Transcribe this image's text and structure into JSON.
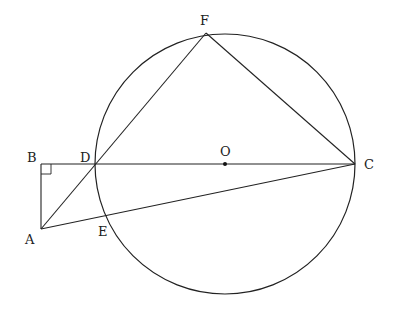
{
  "diagram": {
    "type": "geometry",
    "circle": {
      "center": "O",
      "cx": 225,
      "cy": 164,
      "r": 130
    },
    "points": {
      "A": {
        "label": "A",
        "x": 41,
        "y": 229
      },
      "B": {
        "label": "B",
        "x": 41,
        "y": 164
      },
      "C": {
        "label": "C",
        "x": 355,
        "y": 164
      },
      "D": {
        "label": "D",
        "x": 96,
        "y": 164
      },
      "E": {
        "label": "E",
        "x": 107,
        "y": 217
      },
      "F": {
        "label": "F",
        "x": 206,
        "y": 33
      },
      "O": {
        "label": "O",
        "x": 225,
        "y": 164
      }
    },
    "segments": [
      "BC",
      "AB",
      "AF",
      "AC",
      "FC"
    ],
    "right_angle_at": "B"
  }
}
